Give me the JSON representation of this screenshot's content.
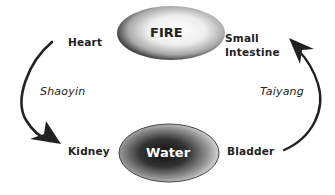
{
  "nodes": {
    "fire": {
      "label": "FIRE"
    },
    "water": {
      "label": "Water"
    }
  },
  "labels": {
    "heart": "Heart",
    "small_intestine_line1": "Small",
    "small_intestine_line2": "Intestine",
    "kidney": "Kidney",
    "bladder": "Bladder",
    "shaoyin": "Shaoyin",
    "taiyang": "Taiyang"
  },
  "edges": [
    {
      "from": "Heart",
      "to": "Kidney",
      "label": "Shaoyin",
      "side": "left"
    },
    {
      "from": "Bladder",
      "to": "Small Intestine",
      "label": "Taiyang",
      "side": "right"
    }
  ],
  "colors": {
    "text": "#222222",
    "arrow": "#222222",
    "fire_center": "#ffffff",
    "fire_edge": "#1a1a1a",
    "water_center": "#111111",
    "water_edge": "#f2f2f2"
  }
}
